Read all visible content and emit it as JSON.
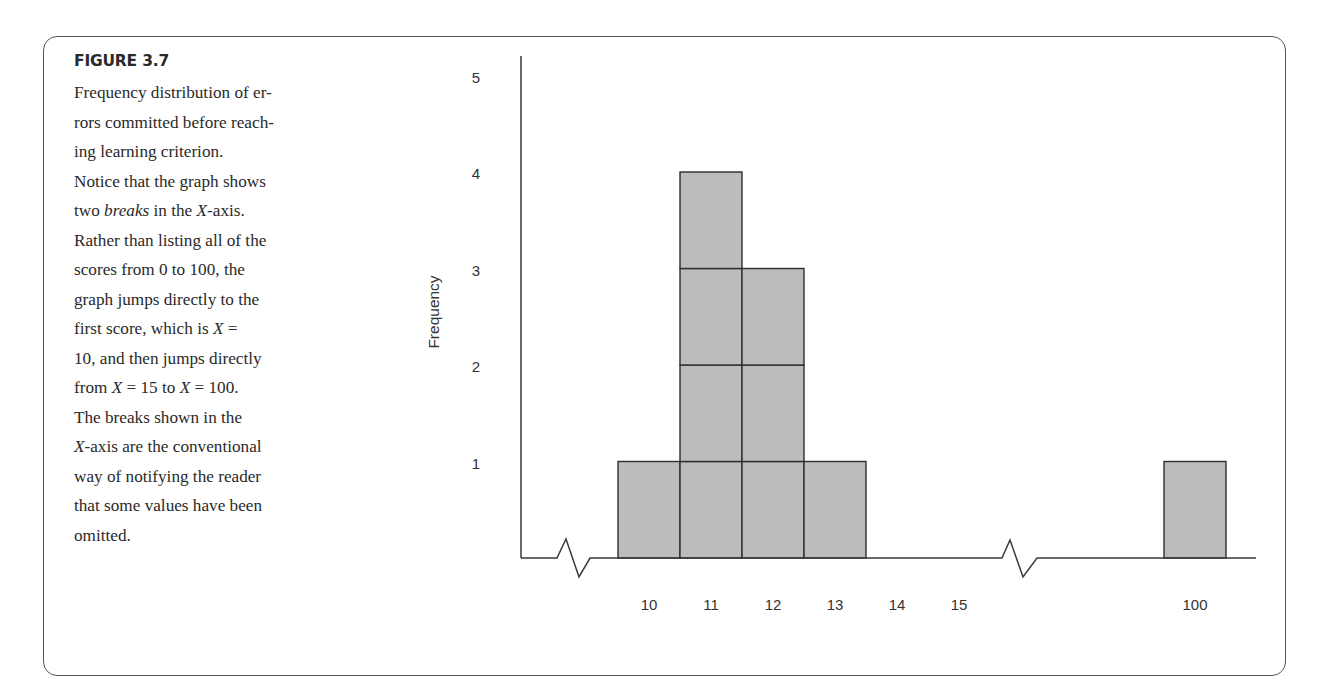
{
  "figure": {
    "label": "FIGURE 3.7",
    "caption_lines": [
      [
        {
          "t": "Frequency distribution of er-"
        }
      ],
      [
        {
          "t": "rors committed before reach-"
        }
      ],
      [
        {
          "t": "ing learning criterion."
        }
      ],
      [
        {
          "t": "Notice that the graph shows"
        }
      ],
      [
        {
          "t": "two "
        },
        {
          "t": "breaks",
          "i": true
        },
        {
          "t": " in the "
        },
        {
          "t": "X",
          "i": true
        },
        {
          "t": "-axis."
        }
      ],
      [
        {
          "t": "Rather than listing all of the"
        }
      ],
      [
        {
          "t": "scores from 0 to 100, the"
        }
      ],
      [
        {
          "t": "graph jumps directly to the"
        }
      ],
      [
        {
          "t": "first score, which is "
        },
        {
          "t": "X",
          "i": true
        },
        {
          "t": " ="
        }
      ],
      [
        {
          "t": "10, and then jumps directly"
        }
      ],
      [
        {
          "t": "from "
        },
        {
          "t": "X",
          "i": true
        },
        {
          "t": " = 15 to "
        },
        {
          "t": "X",
          "i": true
        },
        {
          "t": " = 100."
        }
      ],
      [
        {
          "t": "The breaks shown in the"
        }
      ],
      [
        {
          "t": "X",
          "i": true
        },
        {
          "t": "-axis are the conventional"
        }
      ],
      [
        {
          "t": "way of notifying the reader"
        }
      ],
      [
        {
          "t": "that some values have been"
        }
      ],
      [
        {
          "t": "omitted."
        }
      ]
    ]
  },
  "colors": {
    "bar_fill": "#bcbcbc",
    "bar_stroke": "#2e2e2e",
    "axis": "#3a3a3a",
    "frame": "#555555"
  },
  "chart_data": {
    "type": "bar",
    "subtype": "histogram (stacked unit blocks)",
    "title": "",
    "xlabel": "",
    "ylabel": "Frequency",
    "categories": [
      "10",
      "11",
      "12",
      "13",
      "14",
      "15",
      "100"
    ],
    "values": [
      1,
      4,
      3,
      1,
      0,
      0,
      1
    ],
    "yticks": [
      1,
      2,
      3,
      4,
      5
    ],
    "ylim": [
      0,
      5
    ],
    "x_axis_breaks": [
      "between 0 and 10",
      "between 15 and 100"
    ],
    "grid": false,
    "legend": null
  }
}
